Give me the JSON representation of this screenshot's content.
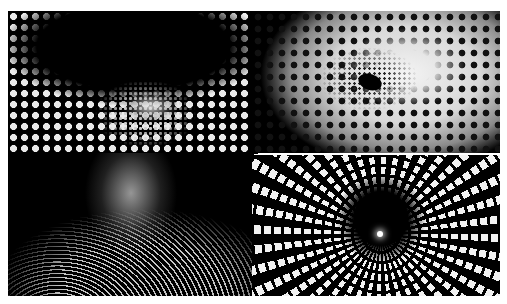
{
  "collage": {
    "layout": "2x2 grid",
    "palette": {
      "background": "#ffffff",
      "dark": "#000000",
      "light": "#eaeaea"
    },
    "panels": [
      {
        "id": "p1",
        "description": "Op-art dotted funnel warping into a glowing center, bright dots at edges"
      },
      {
        "id": "p2",
        "description": "Grey field of black dots spiraling into a dark elliptical hole"
      },
      {
        "id": "p3",
        "description": "Glowing mountain peak formed by flowing white striped lines on black"
      },
      {
        "id": "p4",
        "description": "Radial tunnel of white elongated ellipses converging to a bright center point"
      }
    ]
  }
}
